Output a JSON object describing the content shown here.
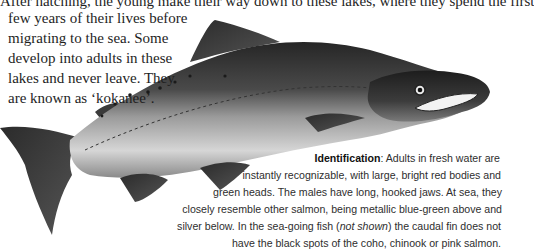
{
  "intro": {
    "lines": [
      "After hatching, the young make their way down to these lakes, where they spend the first",
      "few years of their lives before",
      "migrating to the sea. Some",
      "develop into adults in these",
      "lakes and never leave. They",
      "are known as ‘kokanee’."
    ]
  },
  "identification": {
    "heading": "Identification",
    "line0_rest": ": Adults in fresh water are",
    "line1": "instantly recognizable, with large, bright red bodies and",
    "line2": "green heads. The males have long, hooked jaws. At sea, they",
    "line3": "closely resemble other salmon, being metallic blue-green above and",
    "line4_a": "silver below. In the sea-going fish (",
    "line4_italic": "not shown",
    "line4_b": ") the caudal fin does not",
    "line5": "have the black spots of the coho, chinook or pink salmon."
  },
  "illustration": {
    "subject": "sockeye-salmon-male-illustration"
  }
}
